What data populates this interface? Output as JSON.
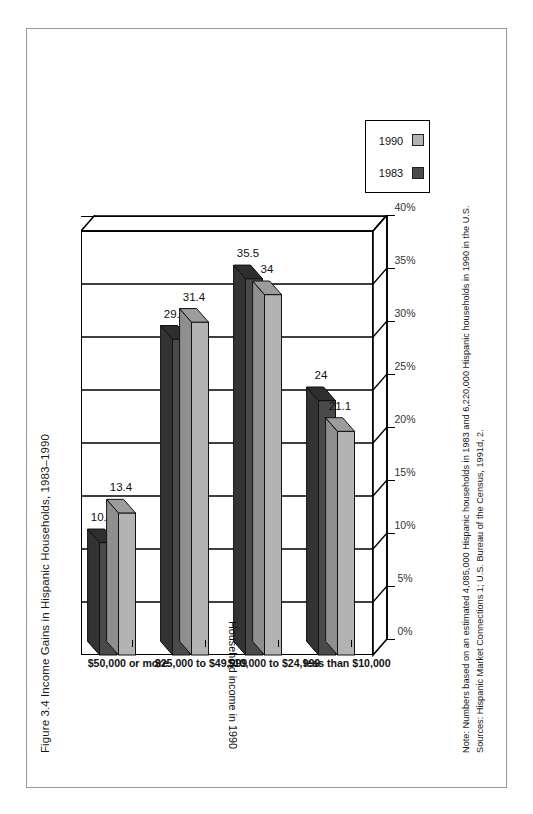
{
  "figure": {
    "title": "Figure 3.4  Income Gains in Hispanic Households, 1983–1990"
  },
  "notes": {
    "note": "Note: Numbers based on an estimated 4,085,000 Hispanic households in 1983 and 6,220,000 Hispanic households in 1990 in the U.S.",
    "sources": "Sources: Hispanic Market Connections 1; U.S. Bureau of the Census, 1991d, 2."
  },
  "legend": {
    "items": [
      {
        "label": "1983",
        "color": "#4a4a4a"
      },
      {
        "label": "1990",
        "color": "#b3b3b3"
      }
    ]
  },
  "axes": {
    "x_title": "Household income in 1990",
    "y_ticks": [
      "0%",
      "5%",
      "10%",
      "15%",
      "20%",
      "25%",
      "30%",
      "35%",
      "40%"
    ]
  },
  "chart_data": {
    "type": "bar",
    "title": "Figure 3.4  Income Gains in Hispanic Households, 1983–1990",
    "orientation": "horizontal",
    "categories": [
      "$50,000 or more",
      "$25,000 to $49,999",
      "$10,000 to $24,999",
      "less than $10,000"
    ],
    "series": [
      {
        "name": "1983",
        "color": "#4a4a4a",
        "values": [
          10.6,
          29.8,
          35.5,
          24
        ]
      },
      {
        "name": "1990",
        "color": "#b3b3b3",
        "values": [
          13.4,
          31.4,
          34,
          21.1
        ]
      }
    ],
    "value_labels": [
      [
        "10.6",
        "13.4"
      ],
      [
        "29.8",
        "31.4"
      ],
      [
        "35.5",
        "34"
      ],
      [
        "24",
        "21.1"
      ]
    ],
    "xlabel": "Household income in 1990",
    "ylabel": "",
    "ylim": [
      0,
      40
    ],
    "ytick_values": [
      0,
      5,
      10,
      15,
      20,
      25,
      30,
      35,
      40
    ],
    "ytick_labels": [
      "0%",
      "5%",
      "10%",
      "15%",
      "20%",
      "25%",
      "30%",
      "35%",
      "40%"
    ],
    "grid": true,
    "legend_position": "top-right",
    "units": "percent of households"
  }
}
